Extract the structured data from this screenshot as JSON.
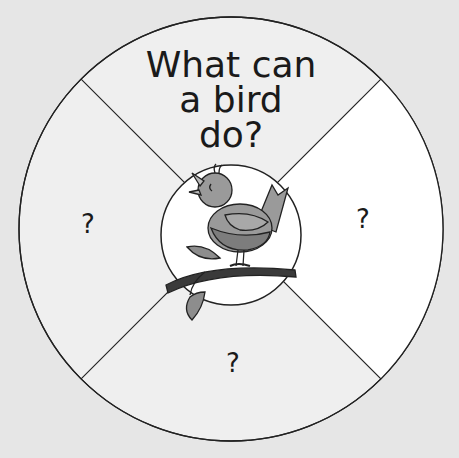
{
  "title_lines": [
    "What can",
    "a bird",
    "do?"
  ],
  "segments": {
    "top": {
      "label": "What can a bird do?"
    },
    "left": {
      "label": "?"
    },
    "right": {
      "label": "?"
    },
    "bottom": {
      "label": "?"
    }
  },
  "center": {
    "image": "bird-on-branch"
  },
  "colors": {
    "background": "#e6e6e6",
    "segment_shaded": "#efefef",
    "segment_white": "#ffffff",
    "outline": "#222222",
    "bird_body": "#9a9a9a",
    "bird_belly": "#7d7d7d",
    "branch": "#3a3a3a"
  }
}
